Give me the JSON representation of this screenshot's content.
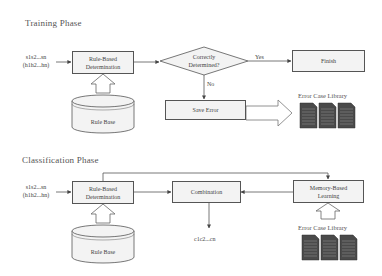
{
  "training": {
    "title": "Training Phase",
    "input_line1": "s1s2...sn",
    "input_line2": "(h1h2...hn)",
    "rule_based_line1": "Rule-Based",
    "rule_based_line2": "Determination",
    "rule_base": "Rule Base",
    "loop_header": "For each syllable si",
    "decision_line1": "Correctly",
    "decision_line2": "Determined?",
    "yes_label": "Yes",
    "no_label": "No",
    "save_error": "Save Error",
    "finish": "Finish",
    "error_case_library": "Error Case Library"
  },
  "classification": {
    "title": "Classification Phase",
    "input_line1": "s1s2...sn",
    "input_line2": "(h1h2...hn)",
    "rule_based_line1": "Rule-Based",
    "rule_based_line2": "Determination",
    "rule_base": "Rule Base",
    "loop_header": "For each syllable si",
    "combination": "Combination",
    "memory_line1": "Memory-Based",
    "memory_line2": "Learning",
    "error_case_library": "Error Case Library",
    "output": "c1c2...cn"
  },
  "colors": {
    "line": "#555555",
    "box_fill": "#f3f3f3",
    "doc_fill": "#4a4a4a"
  }
}
